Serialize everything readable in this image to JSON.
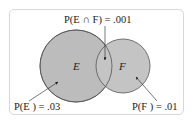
{
  "diagram": {
    "type": "venn",
    "sets": [
      {
        "id": "E",
        "label": "E",
        "probability_label": "P(E ) = .03",
        "fill": "#b9b9b9"
      },
      {
        "id": "F",
        "label": "F",
        "probability_label": "P(F ) = .01",
        "fill": "#c2c2c2"
      }
    ],
    "intersection": {
      "label": "P(E  ∩  F) = .001"
    },
    "stroke": "#555555"
  }
}
